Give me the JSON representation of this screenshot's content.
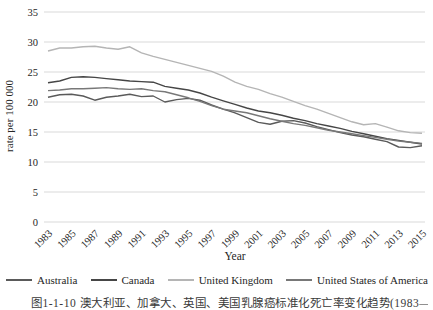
{
  "figure": {
    "y_axis_title": "rate per 100 000",
    "x_axis_title": "Year",
    "caption": "图1-1-10 澳大利亚、加拿大、英国、美国乳腺癌标准化死亡率变化趋势(1983—2015)"
  },
  "chart_data": {
    "type": "line",
    "title": "",
    "xlabel": "Year",
    "ylabel": "rate per 100 000",
    "ylim": [
      0,
      35
    ],
    "y_ticks": [
      0,
      5,
      10,
      15,
      20,
      25,
      30,
      35
    ],
    "grid": "horizontal",
    "gridline_color": "#d9d9d9",
    "legend_position": "bottom",
    "x": [
      1983,
      1984,
      1985,
      1986,
      1987,
      1988,
      1989,
      1990,
      1991,
      1992,
      1993,
      1994,
      1995,
      1996,
      1997,
      1998,
      1999,
      2000,
      2001,
      2002,
      2003,
      2004,
      2005,
      2006,
      2007,
      2008,
      2009,
      2010,
      2011,
      2012,
      2013,
      2014,
      2015
    ],
    "x_tick_labels": [
      "1983",
      "1985",
      "1987",
      "1989",
      "1991",
      "1993",
      "1995",
      "1997",
      "1999",
      "2001",
      "2003",
      "2005",
      "2007",
      "2009",
      "2011",
      "2013",
      "2015"
    ],
    "series": [
      {
        "name": "Australia",
        "color": "#5a5a5a",
        "values": [
          20.8,
          21.2,
          21.3,
          21.0,
          20.3,
          20.8,
          21.0,
          21.3,
          20.9,
          21.0,
          20.0,
          20.4,
          20.6,
          20.3,
          19.5,
          18.8,
          18.2,
          17.4,
          16.6,
          16.3,
          16.8,
          16.9,
          16.5,
          15.9,
          15.4,
          14.9,
          14.5,
          14.2,
          13.8,
          13.4,
          12.5,
          12.4,
          12.7
        ]
      },
      {
        "name": "Canada",
        "color": "#464646",
        "values": [
          23.2,
          23.5,
          24.1,
          24.2,
          24.1,
          23.9,
          23.7,
          23.5,
          23.4,
          23.3,
          22.6,
          22.3,
          22.0,
          21.5,
          20.8,
          20.2,
          19.6,
          19.0,
          18.5,
          18.2,
          17.8,
          17.3,
          16.9,
          16.4,
          16.0,
          15.6,
          15.1,
          14.7,
          14.3,
          13.9,
          13.6,
          13.3,
          13.0
        ]
      },
      {
        "name": "United Kingdom",
        "color": "#b5b5b5",
        "values": [
          28.5,
          29.0,
          29.0,
          29.2,
          29.3,
          29.0,
          28.8,
          29.2,
          28.2,
          27.6,
          27.1,
          26.6,
          26.1,
          25.6,
          25.1,
          24.3,
          23.3,
          22.6,
          22.1,
          21.4,
          20.8,
          20.1,
          19.4,
          18.8,
          18.1,
          17.4,
          16.7,
          16.2,
          16.4,
          15.8,
          15.2,
          14.9,
          14.8
        ]
      },
      {
        "name": "United States of America",
        "color": "#787878",
        "values": [
          21.9,
          22.0,
          22.2,
          22.2,
          22.3,
          22.4,
          22.2,
          22.1,
          22.2,
          21.9,
          21.7,
          21.2,
          20.7,
          20.1,
          19.4,
          18.8,
          18.5,
          18.2,
          17.7,
          17.2,
          16.8,
          16.4,
          16.1,
          15.7,
          15.3,
          15.0,
          14.7,
          14.4,
          14.1,
          13.8,
          13.5,
          13.3,
          13.1
        ]
      }
    ]
  }
}
